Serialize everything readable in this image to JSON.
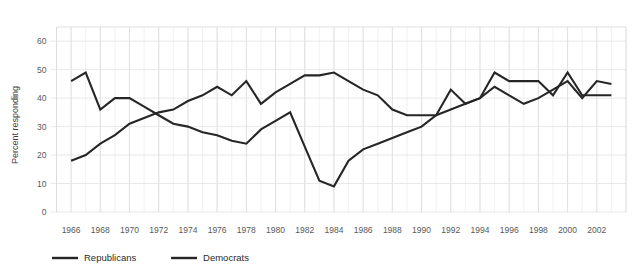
{
  "chart_data": {
    "type": "line",
    "title": "",
    "xlabel": "",
    "ylabel": "Percent responding",
    "ylim": [
      0,
      65
    ],
    "xlim": [
      1965,
      2004
    ],
    "grid": true,
    "legend_position": "bottom-left",
    "y_ticks": [
      0,
      10,
      20,
      30,
      40,
      50,
      60
    ],
    "y_tick_labels": [
      "0",
      "10",
      "20",
      "30",
      "40",
      "50",
      "60"
    ],
    "x_ticks": [
      1966,
      1968,
      1970,
      1972,
      1974,
      1976,
      1978,
      1980,
      1982,
      1984,
      1986,
      1988,
      1990,
      1992,
      1994,
      1996,
      1998,
      2000,
      2002
    ],
    "x_tick_labels": [
      "1966",
      "1968",
      "1970",
      "1972",
      "1974",
      "1976",
      "1978",
      "1980",
      "1982",
      "1984",
      "1986",
      "1988",
      "1990",
      "1992",
      "1994",
      "1996",
      "1998",
      "2000",
      "2002"
    ],
    "x": [
      1966,
      1967,
      1968,
      1969,
      1970,
      1971,
      1972,
      1973,
      1974,
      1975,
      1976,
      1977,
      1978,
      1979,
      1980,
      1981,
      1982,
      1983,
      1984,
      1985,
      1986,
      1987,
      1988,
      1989,
      1990,
      1991,
      1992,
      1993,
      1994,
      1995,
      1996,
      1997,
      1998,
      1999,
      2000,
      2001,
      2002,
      2003
    ],
    "series": [
      {
        "name": "Republicans",
        "color": "#262626",
        "values": [
          46,
          49,
          36,
          40,
          40,
          37,
          34,
          31,
          30,
          28,
          27,
          25,
          24,
          29,
          32,
          35,
          23,
          11,
          9,
          18,
          22,
          24,
          26,
          28,
          30,
          34,
          36,
          38,
          40,
          44,
          41,
          38,
          40,
          43,
          46,
          40,
          46,
          45
        ]
      },
      {
        "name": "Democrats",
        "color": "#262626",
        "values": [
          18,
          20,
          24,
          27,
          31,
          33,
          35,
          36,
          39,
          41,
          44,
          41,
          46,
          38,
          42,
          45,
          48,
          48,
          49,
          46,
          43,
          41,
          36,
          34,
          34,
          34,
          43,
          38,
          40,
          49,
          46,
          46,
          46,
          41,
          49,
          41,
          41,
          41
        ]
      }
    ],
    "legend": [
      {
        "label": "Republicans",
        "color": "#262626"
      },
      {
        "label": "Democrats",
        "color": "#262626"
      }
    ]
  },
  "ylabel": "Percent responding"
}
